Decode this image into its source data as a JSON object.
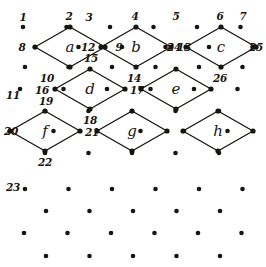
{
  "figure": {
    "width": 266,
    "height": 267,
    "background_color": "#ffffff",
    "ink_color": "#18150f"
  },
  "cells": [
    {
      "id": "cell-a",
      "label": "a",
      "label_x": 70,
      "label_y": 47,
      "top": {
        "x": 70,
        "y": 27
      },
      "left": {
        "x": 35,
        "y": 47
      },
      "right": {
        "x": 105,
        "y": 47
      },
      "bottom": {
        "x": 70,
        "y": 67
      }
    },
    {
      "id": "cell-b",
      "label": "b",
      "label_x": 136,
      "label_y": 47,
      "top": {
        "x": 136,
        "y": 27
      },
      "left": {
        "x": 101,
        "y": 47
      },
      "right": {
        "x": 171,
        "y": 47
      },
      "bottom": {
        "x": 136,
        "y": 67
      }
    },
    {
      "id": "cell-c",
      "label": "c",
      "label_x": 221,
      "label_y": 47,
      "top": {
        "x": 221,
        "y": 27
      },
      "left": {
        "x": 186,
        "y": 47
      },
      "right": {
        "x": 256,
        "y": 47
      },
      "bottom": {
        "x": 221,
        "y": 67
      }
    },
    {
      "id": "cell-d",
      "label": "d",
      "label_x": 90,
      "label_y": 89,
      "top": {
        "x": 90,
        "y": 69
      },
      "left": {
        "x": 55,
        "y": 89
      },
      "right": {
        "x": 125,
        "y": 89
      },
      "bottom": {
        "x": 90,
        "y": 109
      }
    },
    {
      "id": "cell-e",
      "label": "e",
      "label_x": 176,
      "label_y": 89,
      "top": {
        "x": 176,
        "y": 69
      },
      "left": {
        "x": 141,
        "y": 89
      },
      "right": {
        "x": 211,
        "y": 89
      },
      "bottom": {
        "x": 176,
        "y": 109
      }
    },
    {
      "id": "cell-f",
      "label": "f",
      "label_x": 45,
      "label_y": 131,
      "top": {
        "x": 45,
        "y": 111
      },
      "left": {
        "x": 10,
        "y": 131
      },
      "right": {
        "x": 80,
        "y": 131
      },
      "bottom": {
        "x": 45,
        "y": 151
      }
    },
    {
      "id": "cell-g",
      "label": "g",
      "label_x": 132,
      "label_y": 131,
      "top": {
        "x": 132,
        "y": 111
      },
      "left": {
        "x": 97,
        "y": 131
      },
      "right": {
        "x": 167,
        "y": 131
      },
      "bottom": {
        "x": 132,
        "y": 151
      }
    },
    {
      "id": "cell-h",
      "label": "h",
      "label_x": 218,
      "label_y": 131,
      "top": {
        "x": 218,
        "y": 111
      },
      "left": {
        "x": 183,
        "y": 131
      },
      "right": {
        "x": 253,
        "y": 131
      },
      "bottom": {
        "x": 218,
        "y": 151
      }
    }
  ],
  "point_labels": [
    {
      "id": "label-1",
      "text": "1",
      "x": 23,
      "y": 17
    },
    {
      "id": "label-2",
      "text": "2",
      "x": 69,
      "y": 16
    },
    {
      "id": "label-3",
      "text": "3",
      "x": 89,
      "y": 17
    },
    {
      "id": "label-4",
      "text": "4",
      "x": 135,
      "y": 16
    },
    {
      "id": "label-5",
      "text": "5",
      "x": 176,
      "y": 16
    },
    {
      "id": "label-6",
      "text": "6",
      "x": 220,
      "y": 16
    },
    {
      "id": "label-7",
      "text": "7",
      "x": 243,
      "y": 16
    },
    {
      "id": "label-8",
      "text": "8",
      "x": 22,
      "y": 47
    },
    {
      "id": "label-9",
      "text": "9",
      "x": 119,
      "y": 47
    },
    {
      "id": "label-10",
      "text": "10",
      "x": 47,
      "y": 78
    },
    {
      "id": "label-11",
      "text": "11",
      "x": 13,
      "y": 95
    },
    {
      "id": "label-12",
      "text": "12",
      "x": 88,
      "y": 47
    },
    {
      "id": "label-13",
      "text": "13",
      "x": 184,
      "y": 47
    },
    {
      "id": "label-14",
      "text": "14",
      "x": 134,
      "y": 78
    },
    {
      "id": "label-15",
      "text": "15",
      "x": 91,
      "y": 58
    },
    {
      "id": "label-16",
      "text": "16",
      "x": 42,
      "y": 90
    },
    {
      "id": "label-17",
      "text": "17",
      "x": 137,
      "y": 90
    },
    {
      "id": "label-18",
      "text": "18",
      "x": 90,
      "y": 120
    },
    {
      "id": "label-19",
      "text": "19",
      "x": 46,
      "y": 101
    },
    {
      "id": "label-20",
      "text": "20",
      "x": 11,
      "y": 131
    },
    {
      "id": "label-21",
      "text": "21",
      "x": 92,
      "y": 132
    },
    {
      "id": "label-22",
      "text": "22",
      "x": 45,
      "y": 162
    },
    {
      "id": "label-23",
      "text": "23",
      "x": 13,
      "y": 187
    },
    {
      "id": "label-24",
      "text": "24",
      "x": 174,
      "y": 47
    },
    {
      "id": "label-25",
      "text": "25",
      "x": 256,
      "y": 47
    },
    {
      "id": "label-26",
      "text": "26",
      "x": 220,
      "y": 78
    }
  ],
  "lattice_rows": [
    {
      "id": "row-1",
      "y": 27,
      "x_start": 23,
      "count": 6,
      "spacing": 43.5,
      "offset_note": "top row, hosts cell tops 2,4,6 and free points 1,3,5,7"
    },
    {
      "id": "row-2",
      "y": 47,
      "x_start": 35,
      "count": 6,
      "spacing": 43.5,
      "offset_note": "cell a,b,c side vertices"
    },
    {
      "id": "row-3",
      "y": 67,
      "x_start": 25,
      "count": 6,
      "spacing": 43.5,
      "offset_note": "cell bottoms 10,14,26"
    },
    {
      "id": "row-4",
      "y": 89,
      "x_start": 20,
      "count": 6,
      "spacing": 43.5,
      "offset_note": "row with point 11 and cell d,e sides"
    },
    {
      "id": "row-5",
      "y": 111,
      "x_start": 45,
      "count": 5,
      "spacing": 43.5,
      "offset_note": "cell d bottom / f,g,h tops"
    },
    {
      "id": "row-6",
      "y": 131,
      "x_start": 10,
      "count": 6,
      "spacing": 43.5,
      "offset_note": "cell f,g,h side vertices"
    },
    {
      "id": "row-7",
      "y": 153,
      "x_start": 45,
      "count": 5,
      "spacing": 43.5,
      "offset_note": "cell bottoms 22 and free dots"
    },
    {
      "id": "row-8",
      "y": 189,
      "x_start": 25,
      "count": 6,
      "spacing": 43.5,
      "offset_note": "plain lattice row with label 23"
    },
    {
      "id": "row-9",
      "y": 211,
      "x_start": 46,
      "count": 5,
      "spacing": 43.5,
      "offset_note": "plain lattice row"
    },
    {
      "id": "row-10",
      "y": 233,
      "x_start": 24,
      "count": 6,
      "spacing": 43.5,
      "offset_note": "plain lattice row"
    },
    {
      "id": "row-11",
      "y": 256,
      "x_start": 46,
      "count": 5,
      "spacing": 43.5,
      "offset_note": "bottom lattice row"
    }
  ],
  "dot_radius": 2.3,
  "vertex_dot_radius": 2.6
}
